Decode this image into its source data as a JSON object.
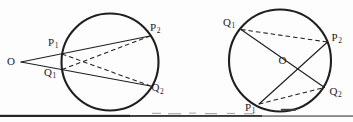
{
  "canvas": {
    "width": 353,
    "height": 122,
    "background": "#fdfdfd",
    "ink": "#1f1f1f"
  },
  "figures": [
    {
      "id": "circle-with-external-point-O-secants",
      "circle": {
        "cx": 110,
        "cy": 62,
        "r": 48.5
      },
      "points": {
        "O": [
          21,
          62
        ],
        "P1": [
          62,
          54
        ],
        "Q1": [
          62,
          69.5
        ],
        "P2": [
          150,
          36
        ],
        "Q2": [
          150.5,
          86
        ]
      },
      "solid_lines": [
        [
          "O",
          "P2"
        ],
        [
          "O",
          "Q2"
        ]
      ],
      "dashed_lines": [
        [
          "P1",
          "Q2"
        ],
        [
          "Q1",
          "P2"
        ]
      ],
      "labels": [
        {
          "text": "O",
          "sub": "",
          "x": 7,
          "y": 55.5
        },
        {
          "text": "P",
          "sub": "1",
          "x": 48,
          "y": 36.5
        },
        {
          "text": "Q",
          "sub": "1",
          "x": 44,
          "y": 66.5
        },
        {
          "text": "P",
          "sub": "2",
          "x": 150,
          "y": 21.5
        },
        {
          "text": "Q",
          "sub": "2",
          "x": 151.5,
          "y": 82
        }
      ]
    },
    {
      "id": "circle-with-internal-point-O-chords",
      "circle": {
        "cx": 280,
        "cy": 60.5,
        "r": 51
      },
      "points": {
        "Q1": [
          241,
          29.5
        ],
        "P2": [
          327.5,
          42
        ],
        "Q2": [
          324.5,
          87.5
        ],
        "P1": [
          259,
          104
        ],
        "O": [
          298,
          69
        ]
      },
      "solid_lines": [
        [
          "Q1",
          "Q2"
        ],
        [
          "P1",
          "P2"
        ]
      ],
      "dashed_lines": [
        [
          "Q1",
          "P2"
        ],
        [
          "P1",
          "Q2"
        ]
      ],
      "labels": [
        {
          "text": "Q",
          "sub": "1",
          "x": 223,
          "y": 16.5
        },
        {
          "text": "P",
          "sub": "2",
          "x": 331.5,
          "y": 31.5
        },
        {
          "text": "O",
          "sub": "",
          "x": 278.5,
          "y": 54.5
        },
        {
          "text": "Q",
          "sub": "2",
          "x": 329.5,
          "y": 85.5
        },
        {
          "text": "P",
          "sub": "1",
          "x": 245,
          "y": 101.5
        }
      ]
    }
  ],
  "bottom_rule": {
    "segments": [
      {
        "x": 0,
        "w": 353,
        "y": 115.4,
        "h": 1.3,
        "color": "#565656"
      },
      {
        "x": 0,
        "w": 130,
        "y": 114.8,
        "h": 2.2,
        "color": "#262626"
      },
      {
        "x": 130,
        "w": 132,
        "y": 115.0,
        "h": 1.8,
        "color": "#3a3a3a"
      }
    ]
  },
  "scan_noise": {
    "dashes": [
      {
        "x": 152,
        "y": 112.8,
        "w": 9,
        "h": 1.1,
        "color": "#a6a6a6"
      },
      {
        "x": 168,
        "y": 113.2,
        "w": 13,
        "h": 1.1,
        "color": "#9d9d9d"
      },
      {
        "x": 189,
        "y": 112.6,
        "w": 7,
        "h": 1.1,
        "color": "#ababab"
      },
      {
        "x": 205,
        "y": 113.1,
        "w": 12,
        "h": 1.1,
        "color": "#9d9d9d"
      },
      {
        "x": 227,
        "y": 112.9,
        "w": 8,
        "h": 1.1,
        "color": "#a6a6a6"
      },
      {
        "x": 244,
        "y": 113.2,
        "w": 10,
        "h": 1.1,
        "color": "#a0a0a0"
      },
      {
        "x": 281,
        "y": 108.8,
        "w": 15,
        "h": 1.9,
        "color": "#3c3c3c"
      }
    ]
  },
  "style": {
    "circle_stroke_width": 2.1,
    "solid_stroke_width": 1.15,
    "dashed_stroke_width": 1.05,
    "dash_pattern": "4.5 3"
  }
}
